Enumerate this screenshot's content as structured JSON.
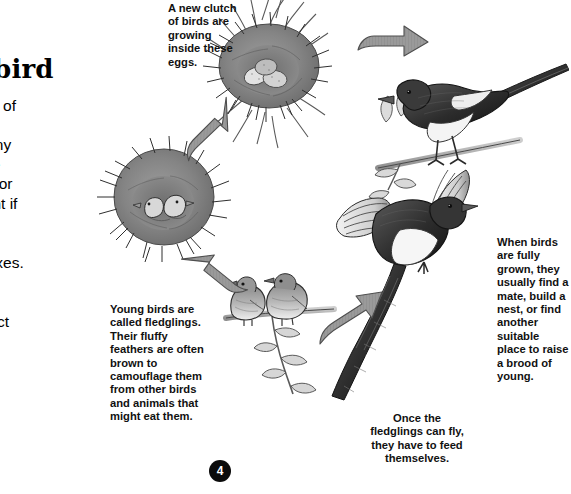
{
  "page": {
    "number": "4",
    "title": "to bird"
  },
  "intro": {
    "lines": [
      " at all stages of",
      "watch birds",
      "n't expect any",
      "look just like",
      " book. Its color",
      "y be different if",
      "or a female.",
      " the more",
      "f the two sexes.",
      "show best",
      "ng season,",
      "ving to attract"
    ]
  },
  "captions": {
    "eggs": {
      "name": "A new clutch of birds are growing inside these eggs.",
      "lines": [
        "A new clutch",
        "of birds are",
        "growing",
        "inside these",
        "eggs."
      ]
    },
    "fledglings": {
      "name": "Young birds are called fledglings.",
      "lines": [
        "Young birds are",
        "called fledglings.",
        "Their fluffy",
        "feathers are often",
        "brown to",
        "camouflage them",
        "from other birds",
        "and animals that",
        "might eat them."
      ]
    },
    "grown": {
      "name": "When birds are fully grown",
      "lines": [
        "When birds",
        "are fully",
        "grown, they",
        "usually find a",
        "mate, build a",
        "nest, or find",
        "another",
        "suitable",
        "place to raise",
        "a brood of",
        "young."
      ]
    },
    "feed": {
      "name": "Once the fledglings can fly",
      "lines": [
        "Once the",
        "fledglings can fly,",
        "they have to feed",
        "themselves."
      ]
    }
  },
  "illustrations": [
    {
      "id": "nest-eggs-top",
      "label": "nest-with-eggs-illustration"
    },
    {
      "id": "nest-chicks-left",
      "label": "nest-with-chicks-illustration"
    },
    {
      "id": "fledglings",
      "label": "two-fledglings-on-branch-illustration"
    },
    {
      "id": "magpie-perched",
      "label": "perched-magpie-illustration"
    },
    {
      "id": "magpie-flying",
      "label": "flying-magpie-illustration"
    }
  ],
  "arrows": [
    {
      "id": "arrow-adult-to-nest",
      "direction": "left"
    },
    {
      "id": "arrow-eggs-to-chicks",
      "direction": "down-left"
    },
    {
      "id": "arrow-chicks-to-fledgling",
      "direction": "down-right"
    },
    {
      "id": "arrow-fledgling-to-adult",
      "direction": "up-right"
    }
  ],
  "colors": {
    "arrow_fill": "#8f8f8f",
    "arrow_stroke": "#4a4a4a",
    "ink": "#1a1a1a",
    "page_number_bg": "#0b0b0b"
  }
}
